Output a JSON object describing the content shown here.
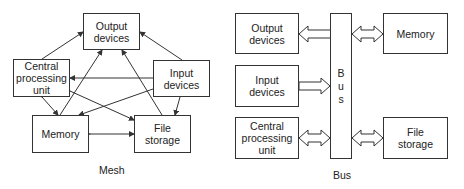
{
  "mesh": {
    "caption": "Mesh",
    "nodes": {
      "output": "Output\ndevices",
      "cpu": "Central\nprocessing\nunit",
      "input": "Input\ndevices",
      "memory": "Memory",
      "file": "File\nstorage"
    },
    "edges": [
      {
        "from": "cpu",
        "to": "output",
        "type": "directed"
      },
      {
        "from": "input",
        "to": "output",
        "type": "directed"
      },
      {
        "from": "memory",
        "to": "output",
        "type": "directed"
      },
      {
        "from": "file",
        "to": "output",
        "type": "directed"
      },
      {
        "from": "input",
        "to": "cpu",
        "type": "directed"
      },
      {
        "from": "input",
        "to": "memory",
        "type": "directed"
      },
      {
        "from": "input",
        "to": "file",
        "type": "directed"
      },
      {
        "from": "cpu",
        "to": "memory",
        "type": "bidirectional"
      },
      {
        "from": "cpu",
        "to": "file",
        "type": "bidirectional"
      },
      {
        "from": "memory",
        "to": "file",
        "type": "bidirectional"
      }
    ]
  },
  "bus": {
    "caption": "Bus",
    "bar_letters": [
      "B",
      "u",
      "s"
    ],
    "nodes": {
      "output": "Output\ndevices",
      "input": "Input\ndevices",
      "cpu": "Central\nprocessing\nunit",
      "memory": "Memory",
      "file": "File\nstorage"
    },
    "connections": [
      {
        "node": "output",
        "direction": "from-bus"
      },
      {
        "node": "input",
        "direction": "to-bus"
      },
      {
        "node": "cpu",
        "direction": "bidirectional"
      },
      {
        "node": "memory",
        "direction": "bidirectional"
      },
      {
        "node": "file",
        "direction": "bidirectional"
      }
    ]
  }
}
